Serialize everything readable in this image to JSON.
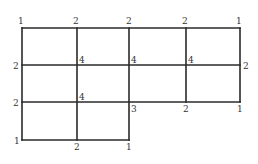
{
  "diagram": {
    "type": "grid-graph",
    "line_color": "#2a2a2a",
    "label_color": "#333333",
    "segments": [
      [
        22,
        28,
        240,
        28
      ],
      [
        22,
        65,
        240,
        65
      ],
      [
        22,
        102,
        240,
        102
      ],
      [
        22,
        140,
        129,
        140
      ],
      [
        22,
        28,
        22,
        140
      ],
      [
        77,
        28,
        77,
        140
      ],
      [
        129,
        28,
        129,
        140
      ],
      [
        186,
        28,
        186,
        102
      ],
      [
        240,
        28,
        240,
        102
      ]
    ],
    "vertex_labels": [
      {
        "id": "v-top-0",
        "text": "1",
        "x": 18,
        "y": 17
      },
      {
        "id": "v-top-1",
        "text": "2",
        "x": 73,
        "y": 17
      },
      {
        "id": "v-top-2",
        "text": "2",
        "x": 126,
        "y": 17
      },
      {
        "id": "v-top-3",
        "text": "2",
        "x": 182,
        "y": 17
      },
      {
        "id": "v-top-4",
        "text": "1",
        "x": 236,
        "y": 17
      },
      {
        "id": "v-mid1-0",
        "text": "2",
        "x": 13,
        "y": 62
      },
      {
        "id": "v-mid1-1",
        "text": "4",
        "x": 79,
        "y": 56
      },
      {
        "id": "v-mid1-2",
        "text": "4",
        "x": 131,
        "y": 56
      },
      {
        "id": "v-mid1-3",
        "text": "4",
        "x": 188,
        "y": 56
      },
      {
        "id": "v-mid1-4",
        "text": "2",
        "x": 243,
        "y": 62
      },
      {
        "id": "v-mid2-0",
        "text": "2",
        "x": 13,
        "y": 99
      },
      {
        "id": "v-mid2-1",
        "text": "4",
        "x": 79,
        "y": 93
      },
      {
        "id": "v-mid2-2",
        "text": "3",
        "x": 131,
        "y": 105
      },
      {
        "id": "v-mid2-3",
        "text": "2",
        "x": 183,
        "y": 105
      },
      {
        "id": "v-mid2-4",
        "text": "1",
        "x": 237,
        "y": 105
      },
      {
        "id": "v-bot-0",
        "text": "1",
        "x": 14,
        "y": 137
      },
      {
        "id": "v-bot-1",
        "text": "2",
        "x": 74,
        "y": 143
      },
      {
        "id": "v-bot-2",
        "text": "1",
        "x": 126,
        "y": 143
      }
    ]
  }
}
